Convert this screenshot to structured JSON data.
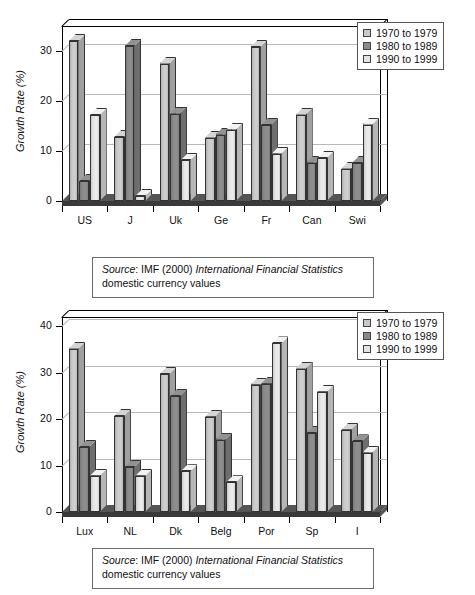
{
  "figure": {
    "charts": [
      {
        "id": "chart-top",
        "ylabel": "Growth Rate (%)",
        "yticks": [
          "0",
          "10",
          "20",
          "30"
        ],
        "categories": [
          "US",
          "J",
          "Uk",
          "Ge",
          "Fr",
          "Can",
          "Swi"
        ],
        "legend": [
          {
            "label": "1970 to 1979",
            "color": "#c8c8c8"
          },
          {
            "label": "1980 to 1989",
            "color": "#8a8a8a"
          },
          {
            "label": "1990 to 1999",
            "color": "#e4e4e4"
          }
        ],
        "source": {
          "prefix": "Source",
          "middle": ": IMF (2000) ",
          "italic": "International Financial Statistics",
          "line2": "domestic currency values"
        }
      },
      {
        "id": "chart-bottom",
        "ylabel": "Growth Rate (%)",
        "yticks": [
          "0",
          "10",
          "20",
          "30",
          "40"
        ],
        "categories": [
          "Lux",
          "NL",
          "Dk",
          "Belg",
          "Por",
          "Sp",
          "I"
        ],
        "legend": [
          {
            "label": "1970 to 1979",
            "color": "#c8c8c8"
          },
          {
            "label": "1980 to 1989",
            "color": "#8a8a8a"
          },
          {
            "label": "1990 to 1999",
            "color": "#e4e4e4"
          }
        ],
        "source": {
          "prefix": "Source",
          "middle": ": IMF (2000) ",
          "italic": "International Financial Statistics",
          "line2": "domestic currency values"
        }
      }
    ]
  },
  "chart_data": [
    {
      "type": "bar",
      "title": "",
      "xlabel": "",
      "ylabel": "Growth Rate (%)",
      "ylim": [
        0,
        35
      ],
      "yticks": [
        0,
        10,
        20,
        30
      ],
      "grid": true,
      "legend_position": "top-right",
      "categories": [
        "US",
        "J",
        "Uk",
        "Ge",
        "Fr",
        "Can",
        "Swi"
      ],
      "series": [
        {
          "name": "1970 to 1979",
          "color": "#c8c8c8",
          "values": [
            32.0,
            12.8,
            27.5,
            12.7,
            30.8,
            17.3,
            6.5
          ]
        },
        {
          "name": "1980 to 1989",
          "color": "#8a8a8a",
          "values": [
            4.0,
            31.0,
            17.5,
            13.3,
            15.2,
            7.7,
            7.6
          ]
        },
        {
          "name": "1990 to 1999",
          "color": "#e4e4e4",
          "values": [
            17.2,
            1.0,
            8.2,
            14.3,
            9.5,
            8.6,
            15.3
          ]
        }
      ]
    },
    {
      "type": "bar",
      "title": "",
      "xlabel": "",
      "ylabel": "Growth Rate (%)",
      "ylim": [
        0,
        42
      ],
      "yticks": [
        0,
        10,
        20,
        30,
        40
      ],
      "grid": true,
      "legend_position": "top-right",
      "categories": [
        "Lux",
        "NL",
        "Dk",
        "Belg",
        "Por",
        "Sp",
        "I"
      ],
      "series": [
        {
          "name": "1970 to 1979",
          "color": "#c8c8c8",
          "values": [
            35.2,
            20.7,
            29.7,
            20.5,
            27.4,
            30.9,
            17.7
          ]
        },
        {
          "name": "1980 to 1989",
          "color": "#8a8a8a",
          "values": [
            14.0,
            9.7,
            25.0,
            15.6,
            27.6,
            17.0,
            15.2
          ]
        },
        {
          "name": "1990 to 1999",
          "color": "#e4e4e4",
          "values": [
            7.8,
            7.8,
            8.8,
            6.4,
            36.3,
            25.9,
            12.8
          ]
        }
      ]
    }
  ]
}
